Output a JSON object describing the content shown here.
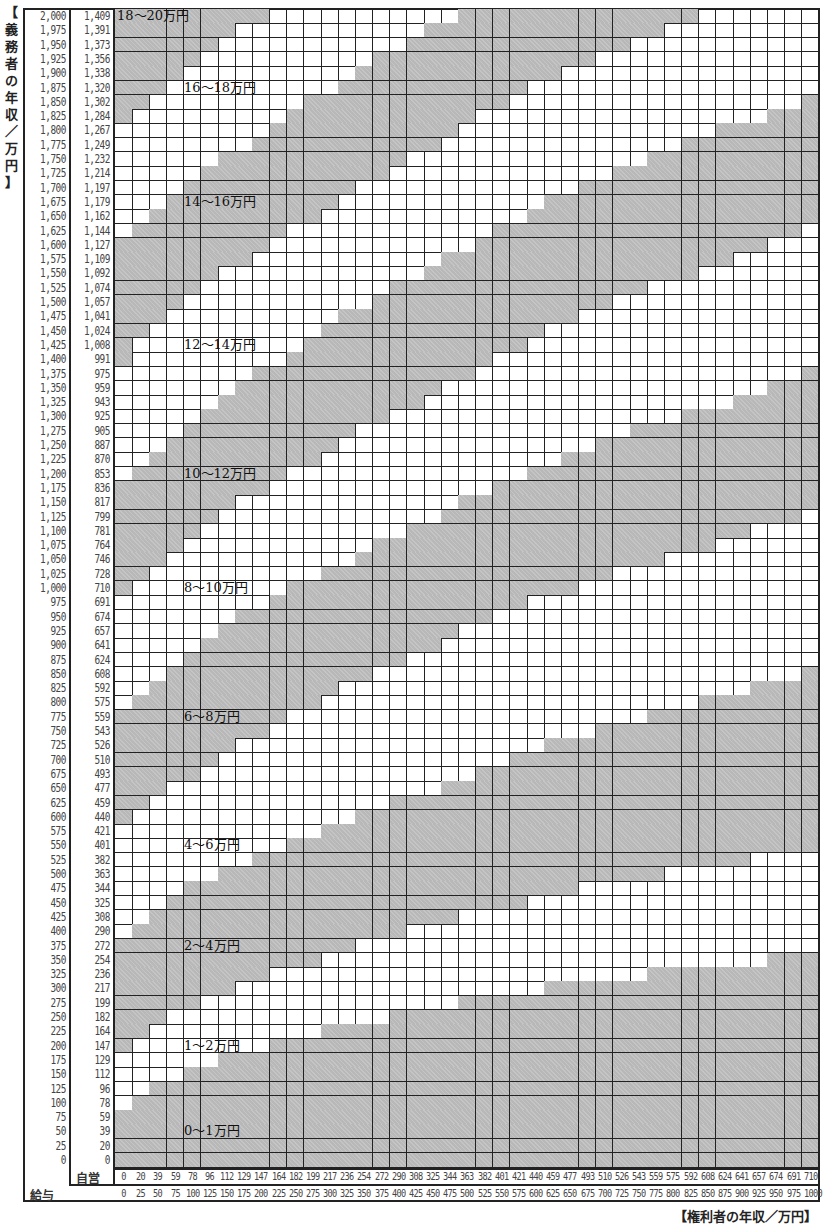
{
  "y_axis_title": "【義務者の年収／万円】",
  "x_axis_title": "【権利者の年収／万円】",
  "row_headers": {
    "self_employed": "自営",
    "salary": "給与"
  },
  "colors": {
    "shade": "#b8b8b8",
    "line": "#222222",
    "background": "#ffffff"
  },
  "chart_data": {
    "type": "heatmap",
    "title": "",
    "xlabel": "権利者の年収／万円",
    "ylabel": "義務者の年収／万円",
    "obligor_salary": [
      "2,000",
      "1,975",
      "1,950",
      "1,925",
      "1,900",
      "1,875",
      "1,850",
      "1,825",
      "1,800",
      "1,775",
      "1,750",
      "1,725",
      "1,700",
      "1,675",
      "1,650",
      "1,625",
      "1,600",
      "1,575",
      "1,550",
      "1,525",
      "1,500",
      "1,475",
      "1,450",
      "1,425",
      "1,400",
      "1,375",
      "1,350",
      "1,325",
      "1,300",
      "1,275",
      "1,250",
      "1,225",
      "1,200",
      "1,175",
      "1,150",
      "1,125",
      "1,100",
      "1,075",
      "1,050",
      "1,025",
      "1,000",
      "975",
      "950",
      "925",
      "900",
      "875",
      "850",
      "825",
      "800",
      "775",
      "750",
      "725",
      "700",
      "675",
      "650",
      "625",
      "600",
      "575",
      "550",
      "525",
      "500",
      "475",
      "450",
      "425",
      "400",
      "375",
      "350",
      "325",
      "300",
      "275",
      "250",
      "225",
      "200",
      "175",
      "150",
      "125",
      "100",
      "75",
      "50",
      "25",
      "0"
    ],
    "obligor_self_employed": [
      "1,409",
      "1,391",
      "1,373",
      "1,356",
      "1,338",
      "1,320",
      "1,302",
      "1,284",
      "1,267",
      "1,249",
      "1,232",
      "1,214",
      "1,197",
      "1,179",
      "1,162",
      "1,144",
      "1,127",
      "1,109",
      "1,092",
      "1,074",
      "1,057",
      "1,041",
      "1,024",
      "1,008",
      "991",
      "975",
      "959",
      "943",
      "925",
      "905",
      "887",
      "870",
      "853",
      "836",
      "817",
      "799",
      "781",
      "764",
      "746",
      "728",
      "710",
      "691",
      "674",
      "657",
      "641",
      "624",
      "608",
      "592",
      "575",
      "559",
      "543",
      "526",
      "510",
      "493",
      "477",
      "459",
      "440",
      "421",
      "401",
      "382",
      "363",
      "344",
      "325",
      "308",
      "290",
      "272",
      "254",
      "236",
      "217",
      "199",
      "182",
      "164",
      "147",
      "129",
      "112",
      "96",
      "78",
      "59",
      "39",
      "20",
      "0"
    ],
    "obligee_self_employed": [
      "0",
      "20",
      "39",
      "59",
      "78",
      "96",
      "112",
      "129",
      "147",
      "164",
      "182",
      "199",
      "217",
      "236",
      "254",
      "272",
      "290",
      "308",
      "325",
      "344",
      "363",
      "382",
      "401",
      "421",
      "440",
      "459",
      "477",
      "493",
      "510",
      "526",
      "543",
      "559",
      "575",
      "592",
      "608",
      "624",
      "641",
      "657",
      "674",
      "691",
      "710"
    ],
    "obligee_salary": [
      "0",
      "25",
      "50",
      "75",
      "100",
      "125",
      "150",
      "175",
      "200",
      "225",
      "250",
      "275",
      "300",
      "325",
      "350",
      "375",
      "400",
      "425",
      "450",
      "475",
      "500",
      "525",
      "550",
      "575",
      "600",
      "625",
      "650",
      "675",
      "700",
      "725",
      "750",
      "775",
      "800",
      "825",
      "850",
      "875",
      "900",
      "925",
      "950",
      "975",
      "1000"
    ],
    "bands": [
      {
        "label": "0～1万円",
        "min": 0,
        "max": 1,
        "shaded": true,
        "label_row": 78
      },
      {
        "label": "1～2万円",
        "min": 1,
        "max": 2,
        "shaded": false,
        "label_row": 72
      },
      {
        "label": "2～4万円",
        "min": 2,
        "max": 4,
        "shaded": true,
        "label_row": 65
      },
      {
        "label": "4～6万円",
        "min": 4,
        "max": 6,
        "shaded": false,
        "label_row": 58
      },
      {
        "label": "6～8万円",
        "min": 6,
        "max": 8,
        "shaded": true,
        "label_row": 49
      },
      {
        "label": "8～10万円",
        "min": 8,
        "max": 10,
        "shaded": false,
        "label_row": 40
      },
      {
        "label": "10～12万円",
        "min": 10,
        "max": 12,
        "shaded": true,
        "label_row": 32
      },
      {
        "label": "12～14万円",
        "min": 12,
        "max": 14,
        "shaded": false,
        "label_row": 23
      },
      {
        "label": "14～16万円",
        "min": 14,
        "max": 16,
        "shaded": true,
        "label_row": 13
      },
      {
        "label": "16～18万円",
        "min": 16,
        "max": 18,
        "shaded": false,
        "label_row": 5
      },
      {
        "label": "18～20万円",
        "min": 18,
        "max": 20,
        "shaded": true,
        "label_row": 0
      }
    ],
    "model": {
      "basic_income_ratio": 0.478,
      "child_index": 55,
      "parent_index": 100
    }
  }
}
